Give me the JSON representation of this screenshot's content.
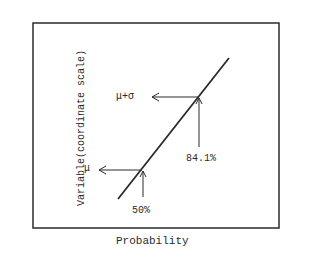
{
  "diagram": {
    "ylabel": "Variable(coordinate scale)",
    "xlabel": "Probability",
    "annotations": {
      "mu": "μ",
      "mu_plus_sigma": "μ+σ",
      "p50": "50%",
      "p841": "84.1%"
    },
    "colors": {
      "ink": "#2a2a2a",
      "background": "#ffffff"
    }
  }
}
